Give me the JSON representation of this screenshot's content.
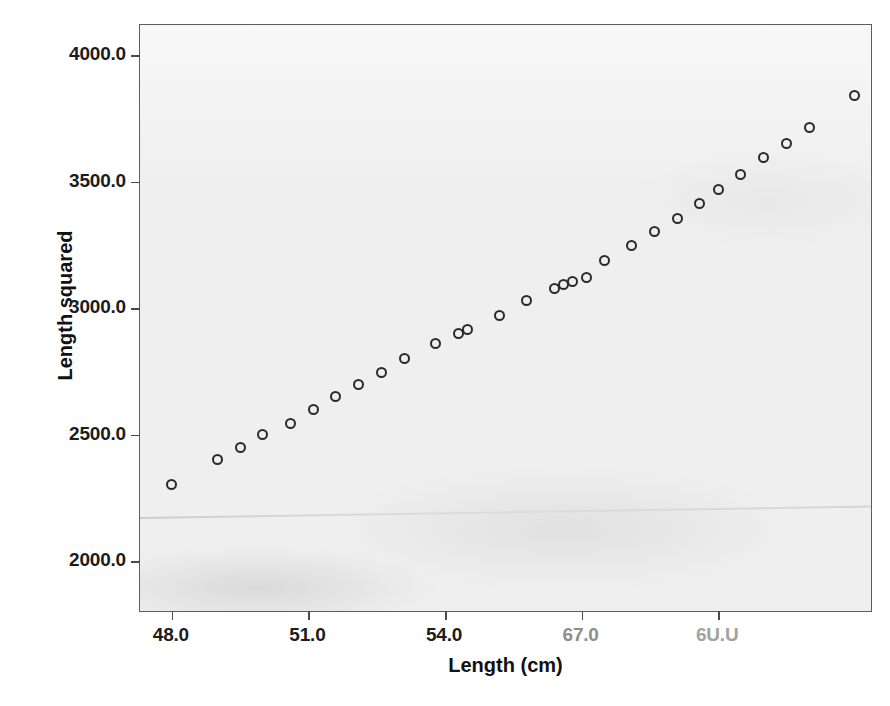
{
  "chart_data": {
    "type": "scatter",
    "title": "",
    "xlabel": "Length (cm)",
    "ylabel": "Length squared",
    "xlim": [
      47.3,
      63.4
    ],
    "ylim": [
      1795,
      4120
    ],
    "grid": false,
    "legend": null,
    "marker": {
      "shape": "circle-open",
      "color": "#2b2b2b",
      "size": 11
    },
    "xticks": [
      48.0,
      51.0,
      54.0,
      57.0,
      60.0
    ],
    "xtick_labels": [
      "48.0",
      "51.0",
      "54.0",
      "67.0",
      "6U.U"
    ],
    "yticks": [
      2000,
      2500,
      3000,
      3500,
      4000
    ],
    "ytick_labels": [
      "2000.0",
      "2500.0",
      "3000.0",
      "3500.0",
      "4000.0"
    ],
    "n_points": 30,
    "x": [
      48.0,
      49.0,
      49.5,
      50.0,
      50.6,
      51.1,
      51.6,
      52.1,
      52.6,
      53.1,
      53.8,
      54.3,
      54.5,
      55.2,
      55.8,
      56.4,
      56.6,
      56.8,
      57.1,
      57.5,
      58.1,
      58.6,
      59.1,
      59.6,
      60.0,
      60.5,
      61.0,
      61.5,
      62.0,
      63.0
    ],
    "y": [
      2305,
      2400,
      2450,
      2500,
      2545,
      2600,
      2650,
      2700,
      2745,
      2800,
      2860,
      2900,
      2915,
      2970,
      3030,
      3080,
      3095,
      3105,
      3120,
      3190,
      3250,
      3305,
      3355,
      3415,
      3470,
      3530,
      3595,
      3650,
      3715,
      3840
    ],
    "points": [
      {
        "x": 48.0,
        "y": 2305
      },
      {
        "x": 49.0,
        "y": 2400
      },
      {
        "x": 49.5,
        "y": 2450
      },
      {
        "x": 50.0,
        "y": 2500
      },
      {
        "x": 50.6,
        "y": 2545
      },
      {
        "x": 51.1,
        "y": 2600
      },
      {
        "x": 51.6,
        "y": 2650
      },
      {
        "x": 52.1,
        "y": 2700
      },
      {
        "x": 52.6,
        "y": 2745
      },
      {
        "x": 53.1,
        "y": 2800
      },
      {
        "x": 53.8,
        "y": 2860
      },
      {
        "x": 54.3,
        "y": 2900
      },
      {
        "x": 54.5,
        "y": 2915
      },
      {
        "x": 55.2,
        "y": 2970
      },
      {
        "x": 55.8,
        "y": 3030
      },
      {
        "x": 56.4,
        "y": 3080
      },
      {
        "x": 56.6,
        "y": 3095
      },
      {
        "x": 56.8,
        "y": 3105
      },
      {
        "x": 57.1,
        "y": 3120
      },
      {
        "x": 57.5,
        "y": 3190
      },
      {
        "x": 58.1,
        "y": 3250
      },
      {
        "x": 58.6,
        "y": 3305
      },
      {
        "x": 59.1,
        "y": 3355
      },
      {
        "x": 59.6,
        "y": 3415
      },
      {
        "x": 60.0,
        "y": 3470
      },
      {
        "x": 60.5,
        "y": 3530
      },
      {
        "x": 61.0,
        "y": 3595
      },
      {
        "x": 61.5,
        "y": 3650
      },
      {
        "x": 62.0,
        "y": 3715
      },
      {
        "x": 63.0,
        "y": 3840
      }
    ]
  },
  "figure": {
    "background_color": "#ffffff",
    "panel_color": "#efefef",
    "frame_color": "#5d5d5d",
    "text_color": "#1c1c1c"
  }
}
